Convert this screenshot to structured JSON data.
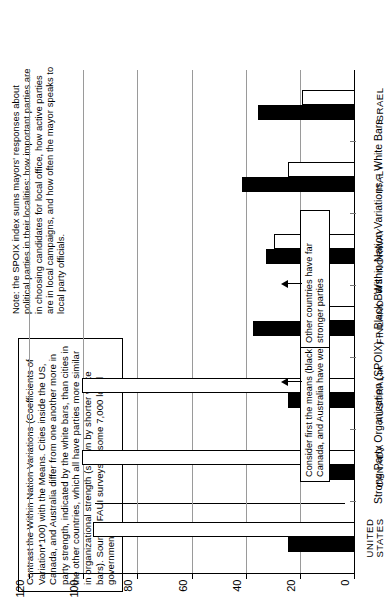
{
  "caption": {
    "text": "Contrast the Within Nation Variations (Coefficients of Variation*100) with the Means. Cities inside the US, Canada, and Australia differ from one another more in party strength, indicated by the white bars, than cities in the other countries, which all have parties more similar in organizational strength (shown by shorter white bars). Source: FAUI surveys of some 7,000 local governments."
  },
  "note": {
    "text": "Note: the SPOIX index sums mayors' responses about political parties in their localities: how important parties are in choosing candidates for local office, how active parties are in local campaigns, and how often the mayor speaks to local party officials."
  },
  "callouts": {
    "weak": "Consider first the means (black bars): the U.S., Canada, and Australia have weak parties",
    "strong": "Other countries have far stronger parties"
  },
  "chart_data": {
    "type": "bar",
    "title": "",
    "orientation": "horizontal-rotated",
    "categories": [
      "UNITED\nSTATES",
      "CANADA",
      "AUSTRALIA",
      "FINLAND",
      "NORWAY",
      "ITALY",
      "ISRAEL"
    ],
    "series": [
      {
        "name": "Strong Party Organization (SPOIX) = Black Bars",
        "color": "#000000",
        "values": [
          24,
          13,
          24,
          37,
          32,
          41,
          35
        ]
      },
      {
        "name": "Within Nation Variations = White Bars",
        "color": "#ffffff",
        "values": [
          96,
          100,
          100,
          16,
          29,
          24,
          19
        ]
      }
    ],
    "ylabel_black": "Strong Party Organization (SPOIX) = Black Bars",
    "ylabel_white": "Within Nation Variations = White Bars",
    "xlabel": "",
    "ylim": [
      0,
      120
    ],
    "yticks": [
      0,
      20,
      40,
      60,
      80,
      100,
      120
    ],
    "ytick_labels": [
      "0",
      "20",
      "40",
      "60",
      "80",
      "100",
      "120"
    ],
    "grid": true,
    "legend": "inline-axis-titles"
  }
}
